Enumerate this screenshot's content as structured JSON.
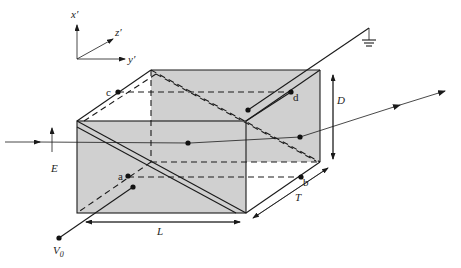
{
  "figure": {
    "fill_color": "#d0d0d0",
    "line_color": "#1a1a1a"
  },
  "axes": {
    "x_label": "x′",
    "y_label": "y′",
    "z_label": "z′"
  },
  "points": {
    "a": "a",
    "b": "b",
    "c": "c",
    "d": "d"
  },
  "dimensions": {
    "length": "L",
    "thickness": "T",
    "depth": "D"
  },
  "field": {
    "label": "E"
  },
  "electrodes": {
    "voltage_label": "V",
    "voltage_subscript": "0",
    "ground_icon": "ground-symbol"
  }
}
